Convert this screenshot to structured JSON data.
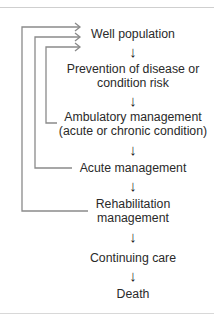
{
  "diagram": {
    "type": "flowchart",
    "direction": "top-to-bottom",
    "nodes": [
      {
        "id": "well",
        "line1": "Well population",
        "line2": ""
      },
      {
        "id": "prevention",
        "line1": "Prevention of disease or",
        "line2": "condition risk"
      },
      {
        "id": "ambulatory",
        "line1": "Ambulatory management",
        "line2": "(acute or chronic condition)"
      },
      {
        "id": "acute",
        "line1": "Acute management",
        "line2": ""
      },
      {
        "id": "rehab",
        "line1": "Rehabilitation",
        "line2": "management"
      },
      {
        "id": "continuing",
        "line1": "Continuing care",
        "line2": ""
      },
      {
        "id": "death",
        "line1": "Death",
        "line2": ""
      }
    ],
    "flow_arrow_glyph": "↓",
    "feedback_loops": [
      {
        "from": "Ambulatory management (acute or chronic condition)",
        "to": "Well population"
      },
      {
        "from": "Acute management",
        "to": "Well population"
      },
      {
        "from": "Rehabilitation management",
        "to": "Well population"
      }
    ],
    "colors": {
      "text": "#2a2a2a",
      "loop_line": "#8a8a8a",
      "rule": "#cfcfcf"
    }
  }
}
